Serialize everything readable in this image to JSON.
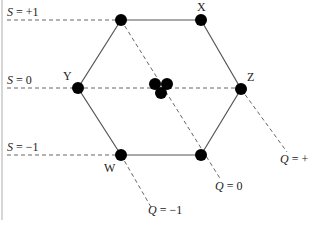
{
  "diagram": {
    "type": "hexagon-weight-diagram",
    "strangeness_levels": [
      {
        "id": "s-plus1",
        "label_var": "S",
        "label_value": "= +1",
        "y": 20
      },
      {
        "id": "s-zero",
        "label_var": "S",
        "label_value": "= 0",
        "y": 88
      },
      {
        "id": "s-minus1",
        "label_var": "S",
        "label_value": "= −1",
        "y": 155
      }
    ],
    "charge_lines": [
      {
        "id": "q-minus1",
        "label_var": "Q",
        "label_value": "= −1"
      },
      {
        "id": "q-zero",
        "label_var": "Q",
        "label_value": "= 0"
      },
      {
        "id": "q-plus1",
        "label_var": "Q",
        "label_value": "= +"
      }
    ],
    "vertices": [
      {
        "id": "top-left",
        "label": ""
      },
      {
        "id": "top-right",
        "label": "X"
      },
      {
        "id": "left",
        "label": "Y"
      },
      {
        "id": "right",
        "label": "Z"
      },
      {
        "id": "bottom-left",
        "label": "W"
      },
      {
        "id": "bottom-right",
        "label": ""
      }
    ],
    "center_cluster_count": 3,
    "colors": {
      "node": "#000000",
      "edge": "#555555",
      "dashed": "#666666",
      "border": "#d6d6d6"
    }
  }
}
